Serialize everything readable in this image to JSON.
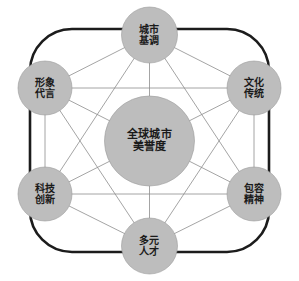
{
  "diagram": {
    "type": "hub-and-spoke-network",
    "title_visible": false,
    "background_color": "#ffffff",
    "frame": {
      "shape": "rounded-rectangle",
      "color": "#1c1c1c",
      "stroke_width": 2.6
    },
    "node_style": {
      "fill": "#bdbdbd",
      "stroke": "#9a9a9a",
      "text_color": "#1a1a1a"
    },
    "link_style": {
      "color": "#8d8d8d",
      "stroke_width": 0.8
    },
    "center_node": {
      "id": "center",
      "line1": "全球城市",
      "line2": "美誉度",
      "cx": 149.5,
      "cy": 141,
      "r": 45
    },
    "outer_nodes": [
      {
        "id": "node-top",
        "line1": "城市",
        "line2": "基调",
        "cx": 149.5,
        "cy": 35,
        "r": 28,
        "position": "top"
      },
      {
        "id": "node-upper-right",
        "line1": "文化",
        "line2": "传统",
        "cx": 254,
        "cy": 88,
        "r": 27,
        "position": "upper-right"
      },
      {
        "id": "node-lower-right",
        "line1": "包容",
        "line2": "精神",
        "cx": 254,
        "cy": 194,
        "r": 27,
        "position": "lower-right"
      },
      {
        "id": "node-bottom",
        "line1": "多元",
        "line2": "人才",
        "cx": 149.5,
        "cy": 246,
        "r": 28,
        "position": "bottom"
      },
      {
        "id": "node-lower-left",
        "line1": "科技",
        "line2": "创新",
        "cx": 45,
        "cy": 194,
        "r": 27,
        "position": "lower-left"
      },
      {
        "id": "node-upper-left",
        "line1": "形象",
        "line2": "代言",
        "cx": 45,
        "cy": 88,
        "r": 27,
        "position": "upper-left"
      }
    ],
    "links": [
      {
        "from": "node-top",
        "to": "node-upper-right"
      },
      {
        "from": "node-top",
        "to": "node-lower-right"
      },
      {
        "from": "node-top",
        "to": "node-bottom"
      },
      {
        "from": "node-top",
        "to": "node-lower-left"
      },
      {
        "from": "node-top",
        "to": "node-upper-left"
      },
      {
        "from": "node-upper-right",
        "to": "node-lower-right"
      },
      {
        "from": "node-upper-right",
        "to": "node-bottom"
      },
      {
        "from": "node-upper-right",
        "to": "node-lower-left"
      },
      {
        "from": "node-upper-right",
        "to": "node-upper-left"
      },
      {
        "from": "node-lower-right",
        "to": "node-bottom"
      },
      {
        "from": "node-lower-right",
        "to": "node-lower-left"
      },
      {
        "from": "node-lower-right",
        "to": "node-upper-left"
      },
      {
        "from": "node-bottom",
        "to": "node-lower-left"
      },
      {
        "from": "node-bottom",
        "to": "node-upper-left"
      },
      {
        "from": "node-lower-left",
        "to": "node-upper-left"
      }
    ]
  }
}
